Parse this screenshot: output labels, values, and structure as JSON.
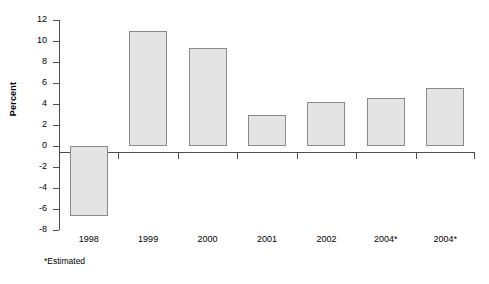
{
  "chart_data": {
    "type": "bar",
    "title": "",
    "subtitle": "",
    "xlabel": "",
    "ylabel": "Percent",
    "ylim": [
      -8,
      12
    ],
    "ytick_step": 2,
    "yticks": [
      12,
      10,
      8,
      6,
      4,
      2,
      0,
      -2,
      -4,
      -6,
      -8
    ],
    "ytick_labels": [
      "12",
      "10",
      "8",
      "6",
      "4",
      "2",
      "0",
      "-2",
      "-4",
      "-6",
      "-8"
    ],
    "categories": [
      "1998",
      "1999",
      "2000",
      "2001",
      "2002",
      "2004*",
      "2004*"
    ],
    "values": [
      -6.7,
      11.0,
      9.3,
      3.0,
      4.2,
      4.6,
      5.5
    ],
    "grid": false,
    "legend": null,
    "annotations": [
      "*Estimated"
    ],
    "bar_fill": "#e4e4e4",
    "bar_border": "#8a8a8a",
    "axis_color": "#4d4d4d"
  },
  "footnote": "*Estimated"
}
